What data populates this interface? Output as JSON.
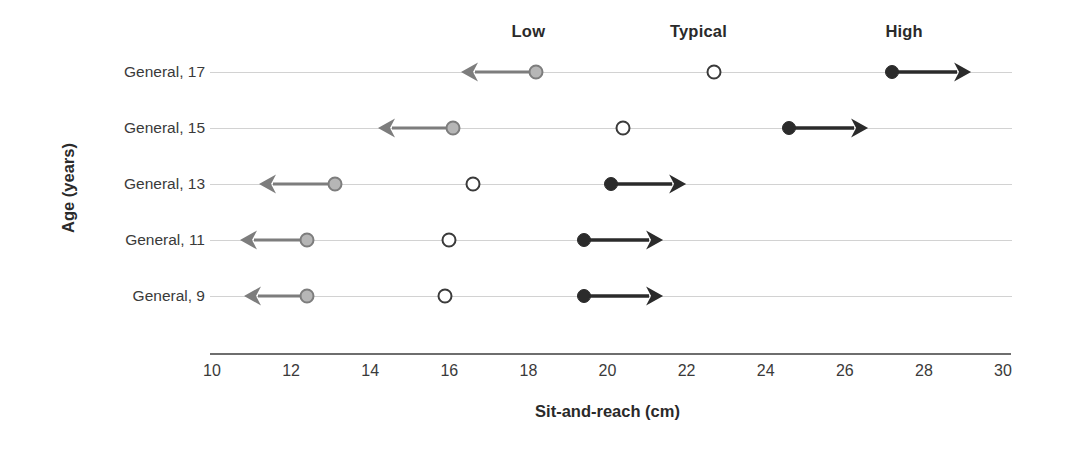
{
  "chart_data": {
    "type": "scatter",
    "title": "",
    "xlabel": "Sit-and-reach (cm)",
    "ylabel": "Age (years)",
    "xlim": [
      10,
      30
    ],
    "xticks": [
      10,
      12,
      14,
      16,
      18,
      20,
      22,
      24,
      26,
      28,
      30
    ],
    "grid": true,
    "legend_position": "top",
    "column_headers": [
      {
        "label": "Low",
        "x": 18.0
      },
      {
        "label": "Typical",
        "x": 22.3
      },
      {
        "label": "High",
        "x": 27.5
      }
    ],
    "categories": [
      "General, 17",
      "General, 15",
      "General, 13",
      "General, 11",
      "General, 9"
    ],
    "series": [
      {
        "name": "Low",
        "marker": "filled-gray-circle",
        "arrow_direction": "left",
        "color": "#b6b6b6",
        "values": [
          18.2,
          16.1,
          13.1,
          12.4,
          12.4
        ],
        "arrow_ends": [
          16.3,
          14.2,
          11.2,
          10.7,
          10.8
        ]
      },
      {
        "name": "Typical",
        "marker": "open-circle",
        "arrow_direction": "none",
        "color": "#ffffff",
        "values": [
          22.7,
          20.4,
          16.6,
          16.0,
          15.9
        ],
        "arrow_ends": [
          null,
          null,
          null,
          null,
          null
        ]
      },
      {
        "name": "High",
        "marker": "filled-black-circle",
        "arrow_direction": "right",
        "color": "#2b2b2b",
        "values": [
          27.2,
          24.6,
          20.1,
          19.4,
          19.4
        ],
        "arrow_ends": [
          29.2,
          26.6,
          22.0,
          21.4,
          21.4
        ]
      }
    ]
  }
}
